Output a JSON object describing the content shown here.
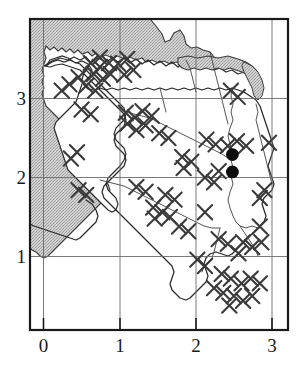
{
  "figure": {
    "kind": "distribution-map",
    "background_color": "#ffffff",
    "frame_color": "#1a1a1a",
    "grid_color": "#6b6b6b",
    "sea_fill": "#bdbdbd",
    "sea_outline": "#3d3d3d",
    "coast_color": "#2b2b2b",
    "river_color": "#4a4a4a",
    "cross_color": "#3a3a3a",
    "dot_color": "#0d0d0d"
  },
  "chart_data": {
    "type": "scatter",
    "title": "",
    "xlabel": "",
    "ylabel": "",
    "xlim": [
      -0.18,
      3.2
    ],
    "ylim": [
      0.08,
      3.62
    ],
    "grid": true,
    "legend": null,
    "xticks": [
      0,
      1,
      2,
      3
    ],
    "yticks": [
      1,
      2,
      3
    ],
    "xtick_labels": [
      "0",
      "1",
      "2",
      "3"
    ],
    "ytick_labels": [
      "1",
      "2",
      "3"
    ],
    "series": [
      {
        "name": "survey-locality",
        "marker": "cross",
        "color": "#3a3a3a",
        "points": [
          [
            0.62,
            3.45
          ],
          [
            0.74,
            3.4
          ],
          [
            0.86,
            3.45
          ],
          [
            0.74,
            3.52
          ],
          [
            0.98,
            3.44
          ],
          [
            1.1,
            3.5
          ],
          [
            0.66,
            3.31
          ],
          [
            0.78,
            3.25
          ],
          [
            0.88,
            3.31
          ],
          [
            0.46,
            3.27
          ],
          [
            0.34,
            3.18
          ],
          [
            0.24,
            3.1
          ],
          [
            0.56,
            3.16
          ],
          [
            0.68,
            3.1
          ],
          [
            1.06,
            3.3
          ],
          [
            1.18,
            3.36
          ],
          [
            2.46,
            3.1
          ],
          [
            2.55,
            3.02
          ],
          [
            0.5,
            2.86
          ],
          [
            0.62,
            2.8
          ],
          [
            1.08,
            2.82
          ],
          [
            1.2,
            2.76
          ],
          [
            1.1,
            2.68
          ],
          [
            1.3,
            2.84
          ],
          [
            1.42,
            2.78
          ],
          [
            1.22,
            2.6
          ],
          [
            1.34,
            2.66
          ],
          [
            1.52,
            2.56
          ],
          [
            1.64,
            2.5
          ],
          [
            2.14,
            2.48
          ],
          [
            2.26,
            2.42
          ],
          [
            2.42,
            2.4
          ],
          [
            2.54,
            2.46
          ],
          [
            2.66,
            2.4
          ],
          [
            2.96,
            2.44
          ],
          [
            0.44,
            2.32
          ],
          [
            0.36,
            2.24
          ],
          [
            1.82,
            2.26
          ],
          [
            1.94,
            2.2
          ],
          [
            1.84,
            2.12
          ],
          [
            2.3,
            2.08
          ],
          [
            2.12,
            2.0
          ],
          [
            2.24,
            1.94
          ],
          [
            0.46,
            1.84
          ],
          [
            0.56,
            1.78
          ],
          [
            2.9,
            1.84
          ],
          [
            2.84,
            1.74
          ],
          [
            1.22,
            1.88
          ],
          [
            1.34,
            1.82
          ],
          [
            1.6,
            1.78
          ],
          [
            1.72,
            1.72
          ],
          [
            1.44,
            1.62
          ],
          [
            1.56,
            1.56
          ],
          [
            1.46,
            1.48
          ],
          [
            1.66,
            1.5
          ],
          [
            2.12,
            1.56
          ],
          [
            1.78,
            1.38
          ],
          [
            1.9,
            1.32
          ],
          [
            2.84,
            1.38
          ],
          [
            2.3,
            1.22
          ],
          [
            2.42,
            1.16
          ],
          [
            2.62,
            1.18
          ],
          [
            2.74,
            1.12
          ],
          [
            2.86,
            1.18
          ],
          [
            2.56,
            1.04
          ],
          [
            2.02,
            0.96
          ],
          [
            2.12,
            0.88
          ],
          [
            2.34,
            0.78
          ],
          [
            2.46,
            0.72
          ],
          [
            2.6,
            0.66
          ],
          [
            2.72,
            0.72
          ],
          [
            2.84,
            0.66
          ],
          [
            2.24,
            0.6
          ],
          [
            2.36,
            0.54
          ],
          [
            2.5,
            0.5
          ],
          [
            2.62,
            0.44
          ],
          [
            2.74,
            0.5
          ],
          [
            2.44,
            0.38
          ]
        ]
      },
      {
        "name": "positive-record",
        "marker": "filled-circle",
        "color": "#0d0d0d",
        "points": [
          [
            2.48,
            2.29
          ],
          [
            2.48,
            2.07
          ]
        ]
      }
    ]
  }
}
